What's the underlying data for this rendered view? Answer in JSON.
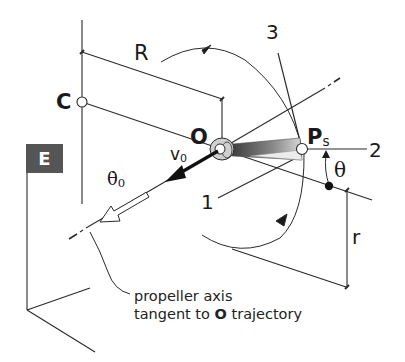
{
  "figure": {
    "frame_label": "E",
    "points": {
      "C": "C",
      "O": "O",
      "Ps_main": "P",
      "Ps_sub": "s"
    },
    "dimensions": {
      "R": "R",
      "r": "r"
    },
    "axes": {
      "axis1": "1",
      "axis2": "2",
      "axis3": "3"
    },
    "angle": "θ",
    "velocity": {
      "main": "v",
      "sub": "0"
    },
    "angular_rate": {
      "main": "θ̇",
      "sub": "0"
    },
    "caption": {
      "line1": "propeller axis",
      "line2_pre": "tangent to ",
      "line2_bold": "O",
      "line2_post": " trajectory"
    },
    "colors": {
      "line": "#2a2a2a",
      "frame_box": "#555555",
      "hub_fill": "#cfcfcf",
      "blade_dark": "#4a4a4a",
      "blade_light": "#e6e6e6"
    }
  }
}
